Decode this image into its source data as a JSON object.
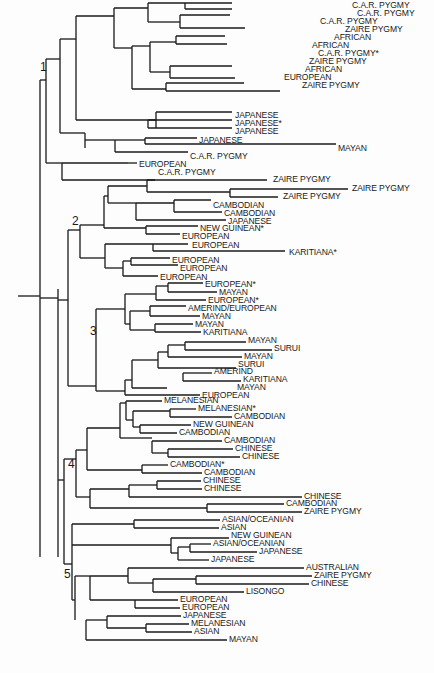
{
  "clade_numbers": [
    {
      "label": "1",
      "x": 40,
      "y": 70
    },
    {
      "label": "2",
      "x": 72,
      "y": 224
    },
    {
      "label": "3",
      "x": 90,
      "y": 334
    },
    {
      "label": "4",
      "x": 68,
      "y": 467
    },
    {
      "label": "5",
      "x": 64,
      "y": 577
    }
  ],
  "leaves": [
    {
      "label": "C.A.R. PYGMY",
      "x": 350,
      "y": 6
    },
    {
      "label": "C.A.R. PYGMY",
      "x": 355,
      "y": 14
    },
    {
      "label": "C.A.R. PYGMY",
      "x": 318,
      "y": 22
    },
    {
      "label": "ZAIRE PYGMY",
      "x": 343,
      "y": 30
    },
    {
      "label": "AFRICAN",
      "x": 332,
      "y": 38
    },
    {
      "label": "AFRICAN",
      "x": 310,
      "y": 46
    },
    {
      "label": "C.A.R. PYGMY*",
      "x": 316,
      "y": 54
    },
    {
      "label": "ZAIRE PYGMY",
      "x": 307,
      "y": 62
    },
    {
      "label": "AFRICAN",
      "x": 303,
      "y": 70
    },
    {
      "label": "EUROPEAN",
      "x": 282,
      "y": 78
    },
    {
      "label": "ZAIRE PYGMY",
      "x": 300,
      "y": 86
    },
    {
      "label": "JAPANESE",
      "x": 233,
      "y": 116
    },
    {
      "label": "JAPANESE*",
      "x": 233,
      "y": 124
    },
    {
      "label": "JAPANESE",
      "x": 233,
      "y": 132
    },
    {
      "label": "JAPANESE",
      "x": 197,
      "y": 141
    },
    {
      "label": "MAYAN",
      "x": 336,
      "y": 149
    },
    {
      "label": "C.A.R. PYGMY",
      "x": 188,
      "y": 157
    },
    {
      "label": "EUROPEAN",
      "x": 137,
      "y": 165
    },
    {
      "label": "C.A.R. PYGMY",
      "x": 156,
      "y": 173
    },
    {
      "label": "ZAIRE PYGMY",
      "x": 271,
      "y": 180
    },
    {
      "label": "ZAIRE PYGMY",
      "x": 350,
      "y": 189
    },
    {
      "label": "ZAIRE PYGMY",
      "x": 281,
      "y": 197
    },
    {
      "label": "CAMBODIAN",
      "x": 211,
      "y": 206
    },
    {
      "label": "CAMBODIAN",
      "x": 222,
      "y": 214
    },
    {
      "label": "JAPANESE",
      "x": 226,
      "y": 222
    },
    {
      "label": "NEW GUINEAN*",
      "x": 198,
      "y": 229
    },
    {
      "label": "EUROPEAN",
      "x": 180,
      "y": 237
    },
    {
      "label": "EUROPEAN",
      "x": 190,
      "y": 246
    },
    {
      "label": "KARITIANA*",
      "x": 287,
      "y": 253
    },
    {
      "label": "EUROPEAN",
      "x": 170,
      "y": 261
    },
    {
      "label": "EUROPEAN",
      "x": 178,
      "y": 269
    },
    {
      "label": "EUROPEAN",
      "x": 158,
      "y": 278
    },
    {
      "label": "EUROPEAN*",
      "x": 203,
      "y": 285
    },
    {
      "label": "MAYAN",
      "x": 217,
      "y": 293
    },
    {
      "label": "EUROPEAN*",
      "x": 206,
      "y": 301
    },
    {
      "label": "AMERIND/EUROPEAN",
      "x": 186,
      "y": 309
    },
    {
      "label": "MAYAN",
      "x": 200,
      "y": 317
    },
    {
      "label": "MAYAN",
      "x": 193,
      "y": 325
    },
    {
      "label": "KARITIANA",
      "x": 201,
      "y": 333
    },
    {
      "label": "MAYAN",
      "x": 246,
      "y": 341
    },
    {
      "label": "SURUI",
      "x": 272,
      "y": 349
    },
    {
      "label": "MAYAN",
      "x": 242,
      "y": 357
    },
    {
      "label": "SURUI",
      "x": 236,
      "y": 365
    },
    {
      "label": "AMERIND",
      "x": 212,
      "y": 372
    },
    {
      "label": "KARITIANA",
      "x": 241,
      "y": 380
    },
    {
      "label": "MAYAN",
      "x": 235,
      "y": 388
    },
    {
      "label": "EUROPEAN",
      "x": 200,
      "y": 396
    },
    {
      "label": "MELANESIAN",
      "x": 162,
      "y": 401
    },
    {
      "label": "MELANESIAN*",
      "x": 196,
      "y": 409
    },
    {
      "label": "CAMBODIAN",
      "x": 232,
      "y": 417
    },
    {
      "label": "NEW GUINEAN",
      "x": 191,
      "y": 425
    },
    {
      "label": "CAMBODIAN",
      "x": 177,
      "y": 433
    },
    {
      "label": "CAMBODIAN",
      "x": 222,
      "y": 441
    },
    {
      "label": "CHINESE",
      "x": 233,
      "y": 449
    },
    {
      "label": "CHINESE",
      "x": 240,
      "y": 457
    },
    {
      "label": "CAMBODIAN*",
      "x": 168,
      "y": 465
    },
    {
      "label": "CAMBODIAN",
      "x": 202,
      "y": 473
    },
    {
      "label": "CHINESE",
      "x": 201,
      "y": 481
    },
    {
      "label": "CHINESE",
      "x": 202,
      "y": 489
    },
    {
      "label": "CHINESE",
      "x": 302,
      "y": 497
    },
    {
      "label": "CAMBODIAN",
      "x": 284,
      "y": 504
    },
    {
      "label": "ZAIRE PYGMY",
      "x": 302,
      "y": 512
    },
    {
      "label": "ASIAN/OCEANIAN",
      "x": 220,
      "y": 520
    },
    {
      "label": "ASIAN",
      "x": 219,
      "y": 528
    },
    {
      "label": "NEW GUINEAN",
      "x": 229,
      "y": 536
    },
    {
      "label": "ASIAN/OCEANIAN",
      "x": 211,
      "y": 544
    },
    {
      "label": "JAPANESE",
      "x": 257,
      "y": 552
    },
    {
      "label": "JAPANESE",
      "x": 209,
      "y": 560
    },
    {
      "label": "AUSTRALIAN",
      "x": 304,
      "y": 568
    },
    {
      "label": "ZAIRE PYGMY",
      "x": 312,
      "y": 576
    },
    {
      "label": "CHINESE",
      "x": 309,
      "y": 584
    },
    {
      "label": "LISONGO",
      "x": 244,
      "y": 592
    },
    {
      "label": "EUROPEAN",
      "x": 178,
      "y": 600
    },
    {
      "label": "EUROPEAN",
      "x": 180,
      "y": 608
    },
    {
      "label": "JAPANESE",
      "x": 181,
      "y": 616
    },
    {
      "label": "MELANESIAN",
      "x": 189,
      "y": 624
    },
    {
      "label": "ASIAN",
      "x": 192,
      "y": 632
    },
    {
      "label": "MAYAN",
      "x": 227,
      "y": 640
    }
  ],
  "segments": [
    [
      18,
      296,
      40,
      296
    ],
    [
      40,
      80,
      40,
      557
    ],
    [
      40,
      80,
      46,
      80
    ],
    [
      46,
      59,
      46,
      163
    ],
    [
      46,
      59,
      60,
      59
    ],
    [
      60,
      39,
      60,
      133
    ],
    [
      60,
      133,
      85,
      133
    ],
    [
      60,
      39,
      76,
      39
    ],
    [
      76,
      16,
      76,
      120
    ],
    [
      76,
      120,
      156,
      120
    ],
    [
      76,
      16,
      114,
      16
    ],
    [
      114,
      8,
      114,
      48
    ],
    [
      114,
      8,
      148,
      8
    ],
    [
      148,
      3,
      148,
      22
    ],
    [
      148,
      3,
      185,
      3
    ],
    [
      185,
      3,
      185,
      9
    ],
    [
      185,
      9,
      232,
      9
    ],
    [
      185,
      3,
      232,
      3
    ],
    [
      148,
      22,
      180,
      22
    ],
    [
      180,
      15,
      180,
      28
    ],
    [
      180,
      15,
      230,
      15
    ],
    [
      180,
      28,
      245,
      28
    ],
    [
      114,
      48,
      132,
      48
    ],
    [
      132,
      46,
      132,
      89
    ],
    [
      132,
      46,
      150,
      46
    ],
    [
      150,
      42,
      150,
      72
    ],
    [
      150,
      42,
      176,
      42
    ],
    [
      176,
      36,
      176,
      44
    ],
    [
      176,
      36,
      225,
      36
    ],
    [
      176,
      44,
      227,
      44
    ],
    [
      150,
      72,
      170,
      72
    ],
    [
      170,
      66,
      170,
      78
    ],
    [
      170,
      66,
      232,
      66
    ],
    [
      170,
      78,
      235,
      78
    ],
    [
      132,
      89,
      166,
      89
    ],
    [
      166,
      83,
      166,
      91
    ],
    [
      166,
      83,
      244,
      83
    ],
    [
      166,
      91,
      280,
      91
    ],
    [
      156,
      112,
      156,
      128
    ],
    [
      156,
      112,
      232,
      112
    ],
    [
      148,
      120,
      148,
      128
    ],
    [
      148,
      120,
      232,
      120
    ],
    [
      148,
      128,
      232,
      128
    ],
    [
      85,
      133,
      85,
      148
    ],
    [
      85,
      140,
      115,
      140
    ],
    [
      115,
      140,
      115,
      152
    ],
    [
      115,
      140,
      145,
      140
    ],
    [
      145,
      138,
      145,
      144
    ],
    [
      145,
      138,
      197,
      138
    ],
    [
      145,
      144,
      336,
      144
    ],
    [
      115,
      152,
      188,
      152
    ],
    [
      46,
      163,
      62,
      163
    ],
    [
      62,
      163,
      62,
      180
    ],
    [
      62,
      163,
      62,
      163
    ],
    [
      62,
      163,
      128,
      163
    ],
    [
      128,
      163,
      137,
      163
    ],
    [
      62,
      180,
      155,
      180
    ],
    [
      40,
      298,
      58,
      298
    ],
    [
      58,
      289,
      58,
      557
    ],
    [
      58,
      300,
      68,
      300
    ],
    [
      68,
      230,
      68,
      386
    ],
    [
      68,
      230,
      80,
      230
    ],
    [
      80,
      225,
      80,
      258
    ],
    [
      80,
      225,
      104,
      225
    ],
    [
      104,
      196,
      104,
      228
    ],
    [
      104,
      196,
      108,
      196
    ],
    [
      108,
      186,
      108,
      203
    ],
    [
      108,
      186,
      147,
      186
    ],
    [
      147,
      180,
      147,
      192
    ],
    [
      147,
      180,
      267,
      180
    ],
    [
      147,
      192,
      230,
      192
    ],
    [
      230,
      189,
      230,
      197
    ],
    [
      230,
      189,
      348,
      189
    ],
    [
      230,
      197,
      278,
      197
    ],
    [
      108,
      203,
      136,
      203
    ],
    [
      136,
      203,
      136,
      220
    ],
    [
      136,
      203,
      174,
      203
    ],
    [
      174,
      200,
      174,
      212
    ],
    [
      174,
      200,
      211,
      200
    ],
    [
      174,
      212,
      222,
      212
    ],
    [
      136,
      220,
      226,
      220
    ],
    [
      104,
      228,
      146,
      228
    ],
    [
      146,
      226,
      146,
      234
    ],
    [
      146,
      226,
      198,
      226
    ],
    [
      146,
      234,
      180,
      234
    ],
    [
      80,
      258,
      105,
      258
    ],
    [
      105,
      244,
      105,
      268
    ],
    [
      105,
      244,
      153,
      244
    ],
    [
      153,
      244,
      153,
      251
    ],
    [
      153,
      244,
      188,
      244
    ],
    [
      153,
      251,
      285,
      251
    ],
    [
      105,
      268,
      123,
      268
    ],
    [
      123,
      261,
      123,
      276
    ],
    [
      123,
      261,
      131,
      261
    ],
    [
      131,
      258,
      131,
      265
    ],
    [
      131,
      258,
      170,
      258
    ],
    [
      131,
      265,
      178,
      265
    ],
    [
      123,
      276,
      158,
      276
    ],
    [
      68,
      386,
      96,
      386
    ],
    [
      96,
      309,
      96,
      391
    ],
    [
      96,
      309,
      125,
      309
    ],
    [
      125,
      294,
      125,
      324
    ],
    [
      125,
      294,
      156,
      294
    ],
    [
      156,
      286,
      156,
      300
    ],
    [
      156,
      286,
      168,
      286
    ],
    [
      168,
      283,
      168,
      292
    ],
    [
      168,
      283,
      203,
      283
    ],
    [
      168,
      292,
      217,
      292
    ],
    [
      156,
      300,
      206,
      300
    ],
    [
      125,
      324,
      130,
      324
    ],
    [
      130,
      311,
      130,
      330
    ],
    [
      130,
      311,
      150,
      311
    ],
    [
      150,
      306,
      150,
      316
    ],
    [
      150,
      306,
      186,
      306
    ],
    [
      150,
      316,
      200,
      316
    ],
    [
      130,
      330,
      155,
      330
    ],
    [
      155,
      324,
      155,
      332
    ],
    [
      155,
      324,
      193,
      324
    ],
    [
      155,
      332,
      201,
      332
    ],
    [
      96,
      391,
      125,
      391
    ],
    [
      125,
      380,
      125,
      395
    ],
    [
      125,
      380,
      132,
      380
    ],
    [
      132,
      360,
      132,
      388
    ],
    [
      132,
      360,
      158,
      360
    ],
    [
      158,
      352,
      158,
      368
    ],
    [
      158,
      352,
      168,
      352
    ],
    [
      168,
      345,
      168,
      357
    ],
    [
      168,
      345,
      185,
      345
    ],
    [
      185,
      342,
      185,
      350
    ],
    [
      185,
      342,
      246,
      342
    ],
    [
      185,
      350,
      272,
      350
    ],
    [
      168,
      357,
      242,
      357
    ],
    [
      158,
      368,
      236,
      368
    ],
    [
      132,
      388,
      167,
      388
    ],
    [
      183,
      373,
      183,
      381
    ],
    [
      183,
      373,
      212,
      373
    ],
    [
      183,
      381,
      241,
      381
    ],
    [
      125,
      395,
      200,
      395
    ],
    [
      58,
      480,
      64,
      480
    ],
    [
      64,
      459,
      64,
      564
    ],
    [
      64,
      459,
      76,
      459
    ],
    [
      76,
      450,
      76,
      497
    ],
    [
      76,
      450,
      87,
      450
    ],
    [
      87,
      428,
      87,
      470
    ],
    [
      87,
      428,
      120,
      428
    ],
    [
      120,
      403,
      120,
      438
    ],
    [
      120,
      403,
      126,
      403
    ],
    [
      126,
      401,
      126,
      420
    ],
    [
      126,
      401,
      162,
      401
    ],
    [
      126,
      420,
      133,
      420
    ],
    [
      133,
      411,
      133,
      427
    ],
    [
      133,
      411,
      170,
      411
    ],
    [
      170,
      409,
      170,
      417
    ],
    [
      170,
      409,
      196,
      409
    ],
    [
      170,
      417,
      232,
      417
    ],
    [
      133,
      427,
      140,
      427
    ],
    [
      140,
      425,
      140,
      433
    ],
    [
      140,
      425,
      191,
      425
    ],
    [
      140,
      433,
      177,
      433
    ],
    [
      120,
      438,
      152,
      438
    ],
    [
      152,
      441,
      152,
      453
    ],
    [
      152,
      441,
      222,
      441
    ],
    [
      152,
      453,
      168,
      453
    ],
    [
      168,
      449,
      168,
      457
    ],
    [
      168,
      449,
      233,
      449
    ],
    [
      168,
      457,
      240,
      457
    ],
    [
      87,
      470,
      142,
      470
    ],
    [
      142,
      465,
      142,
      473
    ],
    [
      142,
      465,
      168,
      465
    ],
    [
      142,
      473,
      202,
      473
    ],
    [
      76,
      497,
      90,
      497
    ],
    [
      90,
      489,
      90,
      508
    ],
    [
      90,
      489,
      129,
      489
    ],
    [
      129,
      485,
      129,
      497
    ],
    [
      129,
      485,
      157,
      485
    ],
    [
      157,
      481,
      157,
      489
    ],
    [
      157,
      481,
      201,
      481
    ],
    [
      157,
      489,
      202,
      489
    ],
    [
      129,
      497,
      302,
      497
    ],
    [
      90,
      508,
      207,
      508
    ],
    [
      207,
      504,
      207,
      512
    ],
    [
      207,
      504,
      284,
      504
    ],
    [
      207,
      512,
      302,
      512
    ],
    [
      64,
      564,
      72,
      564
    ],
    [
      72,
      524,
      72,
      600
    ],
    [
      72,
      524,
      134,
      524
    ],
    [
      134,
      520,
      134,
      528
    ],
    [
      134,
      520,
      220,
      520
    ],
    [
      134,
      528,
      219,
      528
    ],
    [
      72,
      545,
      171,
      545
    ],
    [
      171,
      538,
      171,
      553
    ],
    [
      171,
      538,
      229,
      538
    ],
    [
      171,
      553,
      178,
      553
    ],
    [
      178,
      547,
      178,
      560
    ],
    [
      178,
      547,
      190,
      547
    ],
    [
      190,
      544,
      190,
      552
    ],
    [
      190,
      544,
      211,
      544
    ],
    [
      190,
      552,
      257,
      552
    ],
    [
      178,
      560,
      209,
      560
    ],
    [
      72,
      600,
      75,
      600
    ],
    [
      75,
      576,
      75,
      620
    ],
    [
      75,
      576,
      90,
      576
    ],
    [
      90,
      576,
      90,
      600
    ],
    [
      90,
      576,
      128,
      576
    ],
    [
      128,
      568,
      128,
      583
    ],
    [
      128,
      568,
      304,
      568
    ],
    [
      128,
      583,
      153,
      583
    ],
    [
      153,
      579,
      153,
      592
    ],
    [
      153,
      579,
      196,
      579
    ],
    [
      196,
      576,
      196,
      584
    ],
    [
      196,
      576,
      312,
      576
    ],
    [
      196,
      584,
      309,
      584
    ],
    [
      153,
      592,
      244,
      592
    ],
    [
      90,
      600,
      135,
      600
    ],
    [
      135,
      600,
      135,
      608
    ],
    [
      135,
      600,
      178,
      600
    ],
    [
      135,
      608,
      180,
      608
    ],
    [
      86,
      620,
      86,
      640
    ],
    [
      86,
      620,
      107,
      620
    ],
    [
      107,
      616,
      107,
      628
    ],
    [
      107,
      616,
      181,
      616
    ],
    [
      107,
      628,
      146,
      628
    ],
    [
      146,
      624,
      146,
      632
    ],
    [
      146,
      624,
      189,
      624
    ],
    [
      146,
      632,
      192,
      632
    ],
    [
      86,
      640,
      227,
      640
    ]
  ]
}
